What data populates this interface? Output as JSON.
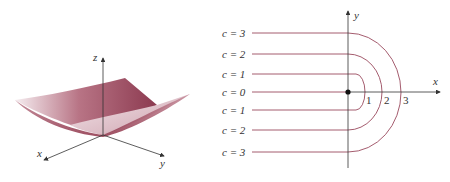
{
  "colors": {
    "contour": "#9a4a5e",
    "axis": "#333333",
    "surface_dark": "#8c2f45",
    "surface_light": "#e9d6dc",
    "text": "#333333"
  },
  "surface_plot": {
    "axes": {
      "x": "x",
      "y": "y",
      "z": "z"
    }
  },
  "contour_plot": {
    "axes": {
      "x": "x",
      "y": "y"
    },
    "ticks": [
      "1",
      "2",
      "3"
    ],
    "labels": [
      {
        "text": "c = 3",
        "y": 33
      },
      {
        "text": "c = 2",
        "y": 54
      },
      {
        "text": "c = 1",
        "y": 74
      },
      {
        "text": "c = 0",
        "y": 92
      },
      {
        "text": "c = 1",
        "y": 110
      },
      {
        "text": "c = 2",
        "y": 130
      },
      {
        "text": "c = 3",
        "y": 152
      }
    ],
    "levels": [
      0,
      1,
      2,
      3
    ]
  }
}
